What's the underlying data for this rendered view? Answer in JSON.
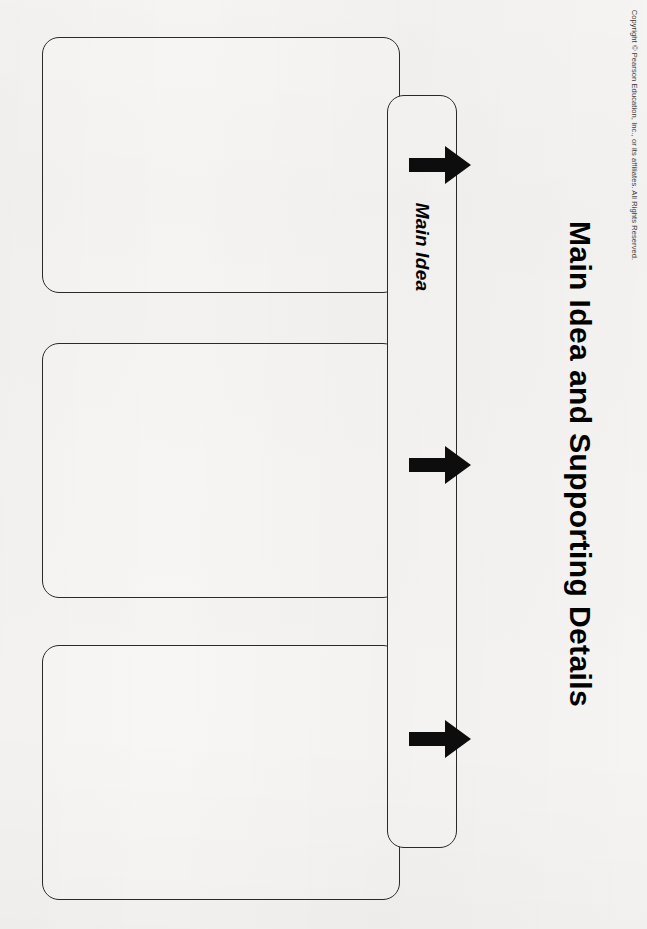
{
  "document": {
    "title": "Main Idea and Supporting Details",
    "copyright": "Copyright © Pearson Education, Inc., or its affiliates. All Rights Reserved.",
    "orientation": "rotated-90-clockwise",
    "background_color": "#f5f4f2",
    "line_color": "#2a2a2a"
  },
  "graphic_organizer": {
    "main_idea": {
      "label": "Main Idea",
      "value": ""
    },
    "supporting_details": {
      "label": "Supporting Details",
      "boxes": [
        {
          "value": ""
        },
        {
          "value": ""
        },
        {
          "value": ""
        }
      ]
    },
    "connectors": [
      {
        "name": "arrow-1",
        "direction": "right"
      },
      {
        "name": "arrow-2",
        "direction": "right"
      },
      {
        "name": "arrow-3",
        "direction": "right"
      }
    ]
  }
}
